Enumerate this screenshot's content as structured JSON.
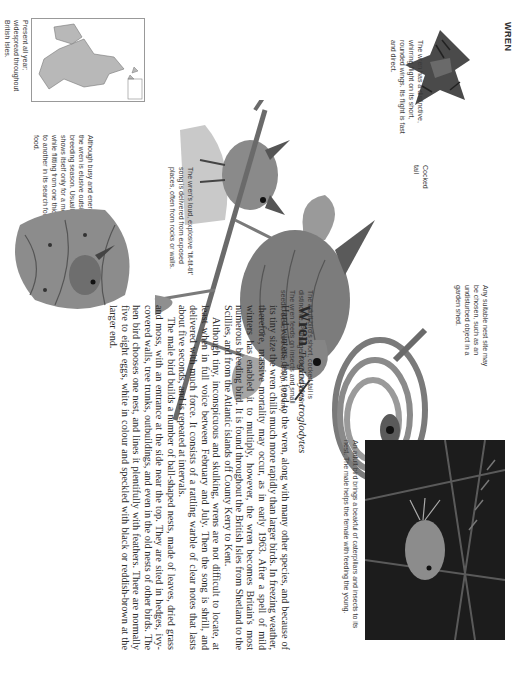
{
  "page": {
    "running_head": "WREN",
    "orientation": "rotated-90-clockwise"
  },
  "captions": {
    "flight": "The wren has a distinctive, whirring flight on its short, rounded wings. Its flight is fast and direct.",
    "song": "The wren's loud, explosive 'tit-tit-tit' song is delivered from exposed places, often from rocks or walls.",
    "distribution": "Present all year; widespread throughout British Isles.",
    "behaviour": "Although busy and energetic, the wren is elusive outside the breeding season. Usually it shows itself only for a moment while flitting from one thicket to another in its search for food.",
    "cocked_tail": "Cocked tail",
    "nest_site": "Any suitable nest site may be chosen, such as an undisturbed object in a garden shed.",
    "adult": "The adult bird's short, cocked tail is distinctive. Plumage is reddish-brown. The wren feeds on insects and small seeds. Sexes are alike. 3¾ in. (9.5 cm).",
    "photo": "An adult bird brings a beakful of caterpillars and insects to its nest. The male helps the female with feeding the young."
  },
  "article": {
    "common_name": "Wren",
    "latin_name": "Troglodytes troglodytes",
    "paragraphs": [
      "Hard winters deny food to the wren, along with many other species, and because of its tiny size the wren chills much more rapidly than larger birds. In freezing weather, therefore, massive mortality may occur, as in early 1963. After a spell of mild winters has enabled it to multiply, however, the wren becomes Britain's most numerous breeding bird. It is found throughout the British Isles from Shetland to the Scillies, and from the Atlantic islands off County Kerry to Kent.",
      "Although tiny, inconspicuous and skulking, wrens are not difficult to locate, at least when in full voice between February and July. Then the song is shrill, and delivered with much force. It consists of a rattling warble of clear notes that lasts about five seconds, and is repeated at intervals.",
      "The male bird builds a number of ball-shaped nests, made of leaves, dried grass and moss, with an entrance at the side near the top. They are sited in hedges, ivy-covered walls, tree trunks, outbuildings, and even in the old nests of other birds. The hen bird chooses one nest, and lines it plentifully with feathers. There are normally five to eight eggs, white in colour and speckled with black or reddish-brown at the larger end."
    ]
  },
  "colors": {
    "text": "#2a2a2a",
    "caption": "#3a3a3a",
    "map_land": "#b8b8b8",
    "photo_bg": "#1a1a1a"
  }
}
